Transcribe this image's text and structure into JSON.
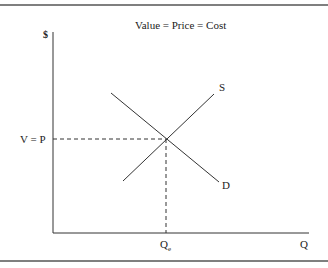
{
  "title": "Value = Price = Cost",
  "axes": {
    "y_label": "$",
    "x_label": "Q"
  },
  "curves": {
    "supply_label": "S",
    "demand_label": "D"
  },
  "equilibrium": {
    "price_label": "V = P",
    "quantity_label": "Q",
    "quantity_subscript": "e"
  },
  "colors": {
    "line": "#333333",
    "border": "#555555"
  }
}
